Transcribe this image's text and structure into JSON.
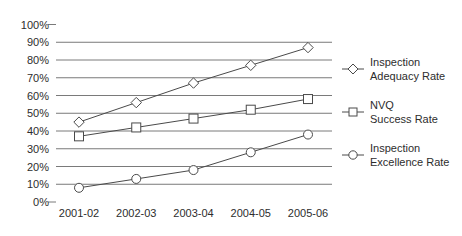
{
  "chart_data": {
    "type": "line",
    "title": "",
    "xlabel": "",
    "ylabel": "",
    "categories": [
      "2001-02",
      "2002-03",
      "2003-04",
      "2004-05",
      "2005-06"
    ],
    "series": [
      {
        "name": "Inspection Adequacy Rate",
        "marker": "diamond",
        "values": [
          45,
          56,
          67,
          77,
          87
        ]
      },
      {
        "name": "NVQ Success Rate",
        "marker": "square",
        "values": [
          37,
          42,
          47,
          52,
          58
        ]
      },
      {
        "name": "Inspection Excellence Rate",
        "marker": "circle",
        "values": [
          8,
          13,
          18,
          28,
          38
        ]
      }
    ],
    "y_ticks": [
      "100%",
      "90%",
      "80%",
      "70%",
      "60%",
      "50%",
      "40%",
      "30%",
      "20%",
      "10%",
      "0%"
    ],
    "y_tick_values": [
      100,
      90,
      80,
      70,
      60,
      50,
      40,
      30,
      20,
      10,
      0
    ],
    "ylim": [
      0,
      100
    ],
    "grid": true,
    "gridlines_full_for": [
      90,
      80,
      70,
      60,
      50,
      40,
      30,
      20,
      10
    ],
    "short_tick_for": [
      100,
      0
    ],
    "legend_position": "right"
  },
  "legend": {
    "items": [
      {
        "marker": "diamond",
        "line1": "Inspection",
        "line2": "Adequacy Rate"
      },
      {
        "marker": "square",
        "line1": "NVQ",
        "line2": "Success Rate"
      },
      {
        "marker": "circle",
        "line1": "Inspection",
        "line2": "Excellence Rate"
      }
    ]
  },
  "colors": {
    "background": "#ffffff",
    "grid": "#7a7a7a",
    "series_line": "#4a4a4a",
    "marker_fill": "#ffffff",
    "text": "#2d2d2d"
  }
}
